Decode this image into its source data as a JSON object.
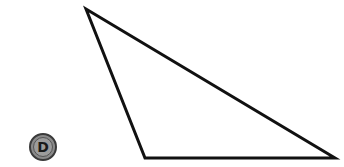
{
  "diagram": {
    "shape": "triangle",
    "vertices": [
      {
        "x": 86,
        "y": 9
      },
      {
        "x": 145,
        "y": 158
      },
      {
        "x": 335,
        "y": 158
      }
    ],
    "stroke_color": "#111111",
    "stroke_width": 3,
    "fill_color": "#ffffff"
  },
  "badge": {
    "label": "D",
    "cx": 43,
    "cy": 147,
    "r": 13,
    "fill_color": "#8a8a8a",
    "ring_color": "#3a3a3a",
    "text_color": "#1a1a1a"
  }
}
